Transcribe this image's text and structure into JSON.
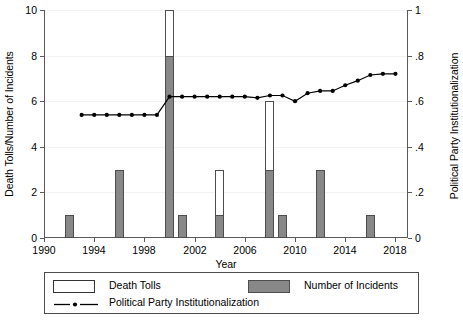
{
  "chart_data": {
    "type": "bar",
    "title": "",
    "xlabel": "Year",
    "ylabel": "Death Tolls/Number of Incidents",
    "ylabel_right": "Political Party Institutionalization",
    "xlim": [
      1990,
      2019
    ],
    "ylim": [
      0,
      10
    ],
    "ylim_right": [
      0,
      1
    ],
    "grid": true,
    "legend_position": "bottom",
    "xticks": [
      "1990",
      "1994",
      "1998",
      "2002",
      "2006",
      "2010",
      "2014",
      "2018"
    ],
    "xtick_values": [
      1990,
      1994,
      1998,
      2002,
      2006,
      2010,
      2014,
      2018
    ],
    "yticks_left": [
      "0",
      "2",
      "4",
      "6",
      "8",
      "10"
    ],
    "ytick_values_left": [
      0,
      2,
      4,
      6,
      8,
      10
    ],
    "yticks_right": [
      "0",
      ".2",
      ".4",
      ".6",
      ".8",
      "1"
    ],
    "ytick_values_right": [
      0,
      0.2,
      0.4,
      0.6,
      0.8,
      1
    ],
    "series": [
      {
        "name": "Number of Incidents",
        "type": "bar",
        "color": "#888888",
        "axis": "left",
        "points": [
          {
            "x": 1992,
            "y": 1
          },
          {
            "x": 1996,
            "y": 3
          },
          {
            "x": 2000,
            "y": 8
          },
          {
            "x": 2001,
            "y": 1
          },
          {
            "x": 2004,
            "y": 1
          },
          {
            "x": 2008,
            "y": 3
          },
          {
            "x": 2009,
            "y": 1
          },
          {
            "x": 2012,
            "y": 3
          },
          {
            "x": 2016,
            "y": 1
          }
        ]
      },
      {
        "name": "Death Tolls",
        "type": "bar",
        "color": "#ffffff",
        "axis": "left",
        "points": [
          {
            "x": 2000,
            "y": 10
          },
          {
            "x": 2004,
            "y": 3
          },
          {
            "x": 2008,
            "y": 6
          }
        ]
      },
      {
        "name": "Political Party Institutionalization",
        "type": "line",
        "color": "#000000",
        "axis": "right",
        "points": [
          {
            "x": 1993,
            "y": 0.54
          },
          {
            "x": 1994,
            "y": 0.54
          },
          {
            "x": 1995,
            "y": 0.54
          },
          {
            "x": 1996,
            "y": 0.54
          },
          {
            "x": 1997,
            "y": 0.54
          },
          {
            "x": 1998,
            "y": 0.54
          },
          {
            "x": 1999,
            "y": 0.54
          },
          {
            "x": 2000,
            "y": 0.62
          },
          {
            "x": 2001,
            "y": 0.62
          },
          {
            "x": 2002,
            "y": 0.62
          },
          {
            "x": 2003,
            "y": 0.62
          },
          {
            "x": 2004,
            "y": 0.62
          },
          {
            "x": 2005,
            "y": 0.62
          },
          {
            "x": 2006,
            "y": 0.62
          },
          {
            "x": 2007,
            "y": 0.615
          },
          {
            "x": 2008,
            "y": 0.625
          },
          {
            "x": 2009,
            "y": 0.625
          },
          {
            "x": 2010,
            "y": 0.6
          },
          {
            "x": 2011,
            "y": 0.635
          },
          {
            "x": 2012,
            "y": 0.645
          },
          {
            "x": 2013,
            "y": 0.645
          },
          {
            "x": 2014,
            "y": 0.67
          },
          {
            "x": 2015,
            "y": 0.69
          },
          {
            "x": 2016,
            "y": 0.715
          },
          {
            "x": 2017,
            "y": 0.72
          },
          {
            "x": 2018,
            "y": 0.72
          }
        ]
      }
    ]
  },
  "legend": {
    "death_tolls_label": "Death Tolls",
    "incidents_label": "Number of Incidents",
    "ppi_label": "Political Party Institutionalization"
  }
}
